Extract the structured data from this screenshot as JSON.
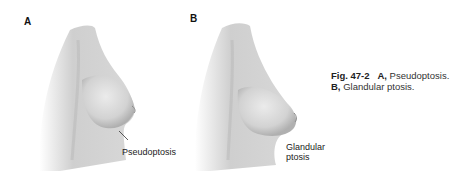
{
  "figure": {
    "panels": [
      {
        "label": "A",
        "callout": "Pseudoptosis"
      },
      {
        "label": "B",
        "callout_line1": "Glandular",
        "callout_line2": "ptosis"
      }
    ],
    "caption": {
      "fig_number": "Fig. 47-2",
      "a_label": "A,",
      "a_text": "Pseudoptosis.",
      "b_label": "B,",
      "b_text": "Glandular ptosis."
    }
  }
}
